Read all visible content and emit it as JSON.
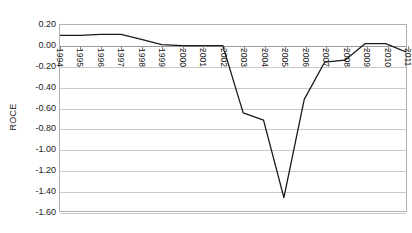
{
  "chart_data": {
    "type": "line",
    "title": "",
    "xlabel": "",
    "ylabel": "ROCE",
    "x": [
      1994,
      1995,
      1996,
      1997,
      1998,
      1999,
      2000,
      2001,
      2002,
      2003,
      2004,
      2005,
      2006,
      2007,
      2008,
      2009,
      2010,
      2011
    ],
    "categories": [
      "1994",
      "1995",
      "1996",
      "1997",
      "1998",
      "1999",
      "2000",
      "2001",
      "2002",
      "2003",
      "2004",
      "2005",
      "2006",
      "2007",
      "2008",
      "2009",
      "2010",
      "2011"
    ],
    "values": [
      0.1,
      0.1,
      0.11,
      0.11,
      0.06,
      0.01,
      0.0,
      0.0,
      0.0,
      -0.65,
      -0.72,
      -1.47,
      -0.52,
      -0.16,
      -0.14,
      0.02,
      0.02,
      -0.06
    ],
    "series": [
      {
        "name": "ROCE",
        "color": "#1a1a1a",
        "values": [
          0.1,
          0.1,
          0.11,
          0.11,
          0.06,
          0.01,
          0.0,
          0.0,
          0.0,
          -0.65,
          -0.72,
          -1.47,
          -0.52,
          -0.16,
          -0.14,
          0.02,
          0.02,
          -0.06
        ]
      }
    ],
    "ylim": [
      -1.6,
      0.2
    ],
    "xlim": [
      1994,
      2011
    ],
    "yticks": [
      0.2,
      0.0,
      -0.2,
      -0.4,
      -0.6,
      -0.8,
      -1.0,
      -1.2,
      -1.4,
      -1.6
    ],
    "ytick_labels": [
      "0.20",
      "0.00",
      "-0.20",
      "-0.40",
      "-0.60",
      "-0.80",
      "-1.00",
      "-1.20",
      "-1.40",
      "-1.60"
    ],
    "grid": "horizontal",
    "legend": "none",
    "x_labels_rotation": 90,
    "plot_border_color": "#b0b0b0",
    "gridline_color": "#c9c9c9"
  }
}
